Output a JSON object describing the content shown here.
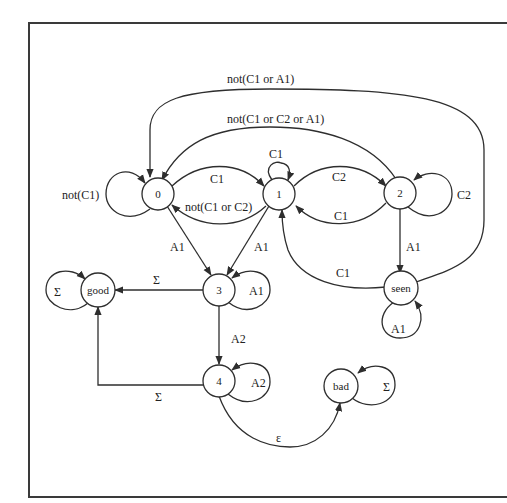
{
  "diagram": {
    "type": "state-machine",
    "nodes": [
      {
        "id": "n0",
        "label": "0"
      },
      {
        "id": "n1",
        "label": "1"
      },
      {
        "id": "n2",
        "label": "2"
      },
      {
        "id": "n3",
        "label": "3"
      },
      {
        "id": "n4",
        "label": "4"
      },
      {
        "id": "good",
        "label": "good"
      },
      {
        "id": "bad",
        "label": "bad"
      },
      {
        "id": "seen",
        "label": "seen"
      }
    ],
    "edges": {
      "n0_self": "not(C1)",
      "n0_n1": "C1",
      "n1_n0": "not(C1 or C2)",
      "n1_self": "C1",
      "n1_n2": "C2",
      "n2_n1": "C1",
      "n2_self": "C2",
      "n2_n0": "not(C1 or C2 or A1)",
      "seen_n0": "not(C1 or A1)",
      "n0_n3": "A1",
      "n1_n3": "A1",
      "n2_seen": "A1",
      "seen_n1": "C1",
      "seen_self": "A1",
      "n3_self": "A1",
      "n3_good": "Σ",
      "good_self": "Σ",
      "n3_n4": "A2",
      "n4_self": "A2",
      "n4_good": "Σ",
      "n4_bad": "ε",
      "bad_self": "Σ"
    }
  }
}
